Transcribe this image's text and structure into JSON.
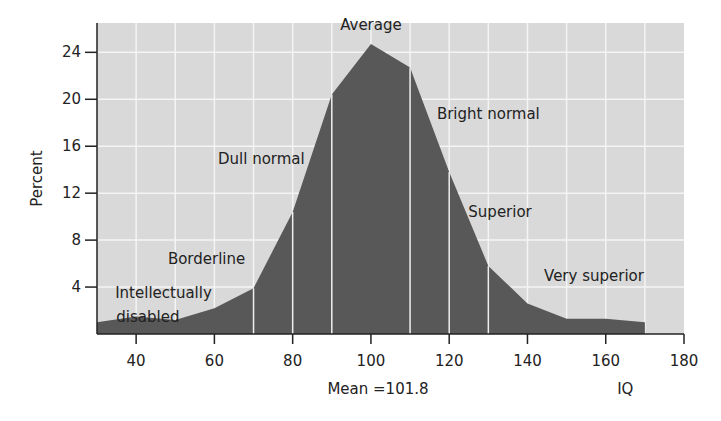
{
  "chart_data": {
    "type": "area",
    "title": "",
    "xlabel": "IQ",
    "ylabel": "Percent",
    "x_annotation": "Mean =101.8",
    "xlim": [
      30,
      180
    ],
    "ylim": [
      0,
      26.5
    ],
    "x_ticks": [
      40,
      60,
      80,
      100,
      120,
      140,
      160,
      180
    ],
    "y_ticks": [
      4,
      8,
      12,
      16,
      20,
      24
    ],
    "grid": true,
    "grid_x_step": 10,
    "grid_y_step": 4,
    "x": [
      30,
      40,
      50,
      60,
      70,
      80,
      90,
      100,
      110,
      120,
      130,
      140,
      150,
      160,
      170
    ],
    "values": [
      1.0,
      1.5,
      1.2,
      2.2,
      3.9,
      10.4,
      20.4,
      24.7,
      22.7,
      13.8,
      5.8,
      2.6,
      1.3,
      1.3,
      1.0
    ],
    "category_boundaries": [
      70,
      80,
      90,
      110,
      120,
      130
    ],
    "annotations": [
      {
        "text": "Average",
        "x": 100,
        "y": 25.9
      },
      {
        "text": "Bright normal",
        "x": 130,
        "y": 18.3
      },
      {
        "text": "Dull normal",
        "x": 72,
        "y": 14.5
      },
      {
        "text": "Superior",
        "x": 133,
        "y": 10.0
      },
      {
        "text": "Borderline",
        "x": 58,
        "y": 6.0
      },
      {
        "text": "Very superior",
        "x": 157,
        "y": 4.5
      },
      {
        "text": "Intellectually",
        "x": 47,
        "y": 3.1
      },
      {
        "text": "disabled",
        "x": 43,
        "y": 1.0
      }
    ],
    "colors": {
      "fill": "#585858",
      "plot_background": "#d9d9d9",
      "grid": "#f4f4f4",
      "boundary_lines": "#efefef",
      "axis": "#222222"
    }
  }
}
